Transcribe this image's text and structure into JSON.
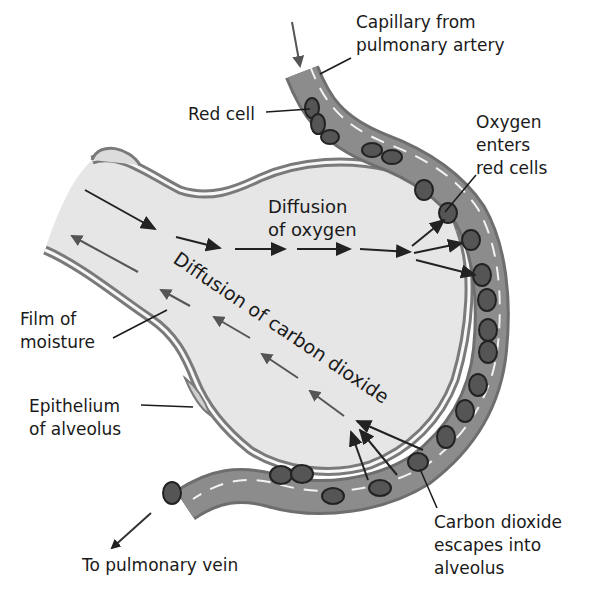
{
  "diagram": {
    "colors": {
      "background": "#ffffff",
      "alveolus_fill": "#e6e6e6",
      "wall_stroke": "#7a7a7a",
      "wall_gap": "#f7f7f7",
      "capillary_fill": "#8c8c8c",
      "red_cell_fill": "#555555",
      "red_cell_stroke": "#222222",
      "arrow_dark": "#222222",
      "arrow_grey": "#555555",
      "text": "#1a1a1a"
    },
    "labels": {
      "capillary_from_artery": [
        "Capillary from",
        "pulmonary artery"
      ],
      "red_cell": "Red cell",
      "oxygen_enters": [
        "Oxygen",
        "enters",
        "red cells"
      ],
      "diffusion_oxygen": [
        "Diffusion",
        "of oxygen"
      ],
      "diffusion_co2": "Diffusion of carbon dioxide",
      "film_of_moisture": [
        "Film of",
        "moisture"
      ],
      "epithelium": [
        "Epithelium",
        "of alveolus"
      ],
      "to_vein": "To pulmonary vein",
      "co2_escapes": [
        "Carbon dioxide",
        "escapes into",
        "alveolus"
      ]
    }
  }
}
